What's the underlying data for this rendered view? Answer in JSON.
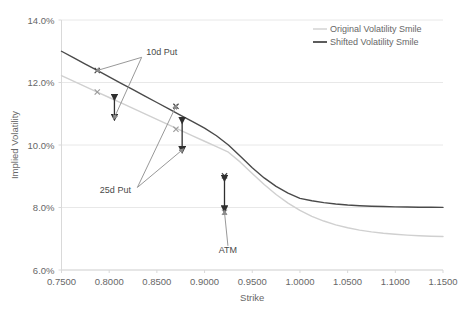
{
  "chart_data": {
    "type": "line",
    "title": "",
    "xlabel": "Strike",
    "ylabel": "Implied Volatility",
    "xlim": [
      0.75,
      1.15
    ],
    "ylim": [
      0.06,
      0.14
    ],
    "xtick_labels": [
      "0.7500",
      "0.8000",
      "0.8500",
      "0.9000",
      "0.9500",
      "1.0000",
      "1.0500",
      "1.1000",
      "1.1500"
    ],
    "xtick_values": [
      0.75,
      0.8,
      0.85,
      0.9,
      0.95,
      1.0,
      1.05,
      1.1,
      1.15
    ],
    "ytick_labels": [
      "6.0%",
      "8.0%",
      "10.0%",
      "12.0%",
      "14.0%"
    ],
    "ytick_values": [
      0.06,
      0.08,
      0.1,
      0.12,
      0.14
    ],
    "grid": "horizontal",
    "legend_position": "top-right",
    "series": [
      {
        "name": "Original Volatility Smile",
        "color": "#d0d0d0",
        "x": [
          0.75,
          0.7625,
          0.775,
          0.7875,
          0.8,
          0.8125,
          0.825,
          0.8375,
          0.85,
          0.8625,
          0.875,
          0.8875,
          0.9,
          0.9125,
          0.925,
          0.9375,
          0.95,
          0.9625,
          0.975,
          0.9875,
          1.0,
          1.0125,
          1.025,
          1.0375,
          1.05,
          1.0625,
          1.075,
          1.0875,
          1.1,
          1.1125,
          1.125,
          1.1375,
          1.15
        ],
        "y": [
          0.1222,
          0.12045,
          0.1187,
          0.11695,
          0.1152,
          0.11345,
          0.1117,
          0.10995,
          0.1082,
          0.10645,
          0.1047,
          0.10295,
          0.1012,
          0.09945,
          0.0977,
          0.09451,
          0.0909,
          0.08736,
          0.08415,
          0.08139,
          0.07908,
          0.07719,
          0.07567,
          0.07446,
          0.07351,
          0.07277,
          0.0722,
          0.07176,
          0.07142,
          0.07116,
          0.07096,
          0.07082,
          0.0707
        ],
        "marker_points": [
          {
            "label": "10d Put",
            "x": 0.7875,
            "y": 0.11695
          },
          {
            "label": "25d Put",
            "x": 0.87,
            "y": 0.10505
          },
          {
            "label": "ATM",
            "x": 0.9209,
            "y": 0.0785
          }
        ]
      },
      {
        "name": "Shifted Volatility Smile",
        "color": "#4a4a4a",
        "x": [
          0.75,
          0.7625,
          0.775,
          0.7875,
          0.8,
          0.8125,
          0.825,
          0.8375,
          0.85,
          0.8625,
          0.875,
          0.8875,
          0.9,
          0.9125,
          0.925,
          0.9375,
          0.95,
          0.9625,
          0.975,
          0.9875,
          1.0,
          1.0125,
          1.025,
          1.0375,
          1.05,
          1.0625,
          1.075,
          1.0875,
          1.1,
          1.1125,
          1.125,
          1.1375,
          1.15
        ],
        "y": [
          0.13,
          0.12795,
          0.1259,
          0.12385,
          0.1218,
          0.11975,
          0.1177,
          0.11565,
          0.1136,
          0.11155,
          0.1095,
          0.10745,
          0.1054,
          0.10297,
          0.1,
          0.09639,
          0.09273,
          0.08947,
          0.08676,
          0.0846,
          0.08291,
          0.08214,
          0.08156,
          0.08113,
          0.08081,
          0.08058,
          0.08042,
          0.0803,
          0.08021,
          0.08015,
          0.0801,
          0.08006,
          0.08003
        ],
        "marker_points": [
          {
            "label": "10d Put",
            "x": 0.7875,
            "y": 0.12385
          },
          {
            "label": "25d Put",
            "x": 0.87,
            "y": 0.11237
          },
          {
            "label": "ATM",
            "x": 0.9209,
            "y": 0.09013
          }
        ]
      }
    ],
    "annotations": [
      {
        "label": "10d Put",
        "x": 0.855,
        "y": 0.1287
      },
      {
        "label": "25d Put",
        "x": 0.8065,
        "y": 0.0845
      },
      {
        "label": "ATM",
        "x": 0.9245,
        "y": 0.0655
      }
    ],
    "shift_arrows": [
      {
        "name": "10d-put-shift",
        "x": 0.8055,
        "y_low": 0.1088,
        "y_high": 0.1152
      },
      {
        "name": "25d-put-shift",
        "x": 0.8765,
        "y_low": 0.0984,
        "y_high": 0.1078
      },
      {
        "name": "atm-shift",
        "x": 0.9209,
        "y_low": 0.0795,
        "y_high": 0.0893
      }
    ]
  },
  "legend": {
    "items": [
      {
        "label": "Original Volatility Smile",
        "color": "#d0d0d0"
      },
      {
        "label": "Shifted Volatility Smile",
        "color": "#4a4a4a"
      }
    ]
  }
}
